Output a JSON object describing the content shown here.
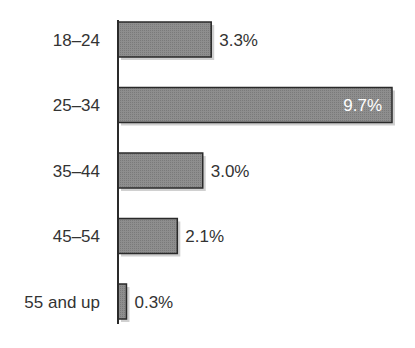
{
  "chart_data": {
    "type": "bar",
    "orientation": "horizontal",
    "title": "",
    "xlabel": "",
    "ylabel": "",
    "categories": [
      "18–24",
      "25–34",
      "35–44",
      "45–54",
      "55 and up"
    ],
    "values": [
      3.3,
      9.7,
      3.0,
      2.1,
      0.3
    ],
    "value_labels": [
      "3.3%",
      "9.7%",
      "3.0%",
      "2.1%",
      "0.3%"
    ],
    "xlim": [
      0,
      9.7
    ],
    "grid": false,
    "legend": "none",
    "colors": {
      "bar": "#8c8c8c",
      "bar_edge": "#2a2a2a",
      "shadow": "#d0d0d0",
      "axis": "#2a2a2a",
      "text": "#333333"
    }
  }
}
